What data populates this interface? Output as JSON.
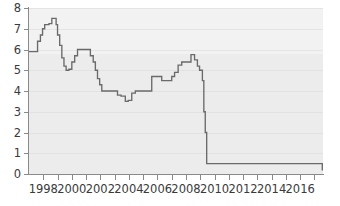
{
  "chart_data": {
    "type": "line",
    "title": "",
    "subtitle": "",
    "xlabel": "",
    "ylabel": "",
    "xlim": [
      1997.0,
      2017.6
    ],
    "ylim": [
      0,
      8
    ],
    "grid": true,
    "legend": null,
    "line_style": "step",
    "line_color": "#6a6a6a",
    "plot_background": "#ececec",
    "axis_color": "#8a8a8a",
    "text_color": "#3a3a3a",
    "yticks": [
      0,
      1,
      2,
      3,
      4,
      5,
      6,
      7,
      8
    ],
    "ytick_labels": [
      "0",
      "1",
      "2",
      "3",
      "4",
      "5",
      "6",
      "7",
      "8"
    ],
    "xticks": [
      1998,
      1999,
      2000,
      2001,
      2002,
      2003,
      2004,
      2005,
      2006,
      2007,
      2008,
      2009,
      2010,
      2011,
      2012,
      2013,
      2014,
      2015,
      2016,
      2017
    ],
    "xtick_labels_major": [
      "1998",
      "2000",
      "2002",
      "2004",
      "2006",
      "2008",
      "2010",
      "2012",
      "2014",
      "2016"
    ],
    "xticks_major": [
      1998,
      2000,
      2002,
      2004,
      2006,
      2008,
      2010,
      2012,
      2014,
      2016
    ],
    "series": [
      {
        "name": "policy rate",
        "x": [
          1997.0,
          1997.45,
          1997.6,
          1997.8,
          1997.95,
          1998.1,
          1998.25,
          1998.4,
          1998.6,
          1998.75,
          1998.9,
          1999.0,
          1999.15,
          1999.3,
          1999.45,
          1999.6,
          1999.8,
          2000.0,
          2000.2,
          2000.4,
          2000.55,
          2000.75,
          2001.3,
          2001.5,
          2001.65,
          2001.8,
          2001.95,
          2002.1,
          2003.0,
          2003.2,
          2003.45,
          2003.75,
          2003.95,
          2004.2,
          2004.45,
          2005.6,
          2005.8,
          2006.3,
          2006.55,
          2006.8,
          2007.0,
          2007.2,
          2007.45,
          2007.7,
          2008.35,
          2008.6,
          2008.8,
          2008.95,
          2009.05,
          2009.15,
          2009.25,
          2009.35,
          2009.45,
          2016.5,
          2017.55
        ],
        "y": [
          5.9,
          5.9,
          6.4,
          6.7,
          7.0,
          7.2,
          7.2,
          7.25,
          7.5,
          7.5,
          7.2,
          6.7,
          6.2,
          5.6,
          5.2,
          5.0,
          5.05,
          5.4,
          5.7,
          6.0,
          6.0,
          6.0,
          5.7,
          5.4,
          5.0,
          4.6,
          4.3,
          4.0,
          4.0,
          3.8,
          3.75,
          3.5,
          3.55,
          3.9,
          4.0,
          4.7,
          4.7,
          4.5,
          4.5,
          4.5,
          4.7,
          4.9,
          5.25,
          5.4,
          5.75,
          5.5,
          5.2,
          5.0,
          5.0,
          4.5,
          3.0,
          2.0,
          0.5,
          0.5,
          0.2
        ],
        "description": "Stepped policy interest rate, 1997-2017, peaking at 7.5 in 1998, collapsing to 0.5 in mid-2009, stepping to 0.2 in late 2016"
      }
    ],
    "key_points": {
      "start_value": 5.9,
      "peak_value": 7.5,
      "peak_year": 1998.6,
      "secondary_peak_value": 6.0,
      "secondary_peak_year": 2000.8,
      "trough_value": 3.5,
      "trough_year": 2003.75,
      "pre_crisis_peak_value": 5.75,
      "pre_crisis_peak_year": 2008.35,
      "post_crisis_floor": 0.5,
      "post_crisis_floor_year": 2009.45,
      "final_value": 0.2,
      "final_step_year": 2016.5
    }
  }
}
